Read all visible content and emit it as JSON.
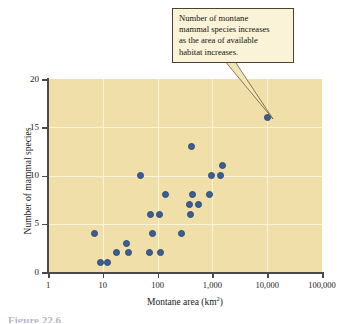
{
  "figure": {
    "background": "#ffffff",
    "panel_color": "#f0dfa8",
    "dot_color": "#3b5f94",
    "callout_color": "#fbf3d8",
    "caption_fragment": "Figure 22.6"
  },
  "callout": {
    "lines": [
      "Number of montane",
      "mammal species increases",
      "as the area of available",
      "habitat increases."
    ],
    "full_text": "Number of montane mammal species increases as the area of available habitat increases."
  },
  "axes": {
    "x_title_main": "Montane area (km",
    "x_title_sup": "2",
    "x_title_close": ")",
    "y_title": "Number of mammal species",
    "x_tick_labels": [
      "1",
      "10",
      "100",
      "1,000",
      "10,000",
      "100,000"
    ],
    "y_tick_labels": [
      "0",
      "5",
      "10",
      "15",
      "20"
    ]
  },
  "chart_data": {
    "type": "scatter",
    "title": "",
    "xlabel": "Montane area (km2)",
    "ylabel": "Number of mammal species",
    "xscale": "log",
    "yscale": "linear",
    "xlim": [
      1,
      100000
    ],
    "ylim": [
      0,
      20
    ],
    "xticks": [
      1,
      10,
      100,
      1000,
      10000,
      100000
    ],
    "xticklabels": [
      "1",
      "10",
      "100",
      "1,000",
      "10,000",
      "100,000"
    ],
    "yticks": [
      0,
      5,
      10,
      15,
      20
    ],
    "yticklabels": [
      "0",
      "5",
      "10",
      "15",
      "20"
    ],
    "grid": "horizontal-and-vertical-white",
    "legend": "none",
    "annotations": [
      {
        "text": "Number of montane mammal species increases as the area of available habitat increases.",
        "points_to": [
          10000,
          16
        ]
      }
    ],
    "points": [
      {
        "x": 7,
        "y": 4
      },
      {
        "x": 9,
        "y": 1
      },
      {
        "x": 12,
        "y": 1
      },
      {
        "x": 18,
        "y": 2
      },
      {
        "x": 27,
        "y": 3
      },
      {
        "x": 29,
        "y": 2
      },
      {
        "x": 48,
        "y": 10
      },
      {
        "x": 70,
        "y": 2
      },
      {
        "x": 75,
        "y": 6
      },
      {
        "x": 80,
        "y": 4
      },
      {
        "x": 110,
        "y": 6
      },
      {
        "x": 115,
        "y": 2
      },
      {
        "x": 140,
        "y": 8
      },
      {
        "x": 270,
        "y": 4
      },
      {
        "x": 380,
        "y": 7
      },
      {
        "x": 390,
        "y": 6
      },
      {
        "x": 420,
        "y": 13
      },
      {
        "x": 430,
        "y": 8
      },
      {
        "x": 560,
        "y": 7
      },
      {
        "x": 900,
        "y": 8
      },
      {
        "x": 950,
        "y": 10
      },
      {
        "x": 1400,
        "y": 10
      },
      {
        "x": 1500,
        "y": 11
      },
      {
        "x": 10000,
        "y": 16
      }
    ]
  }
}
